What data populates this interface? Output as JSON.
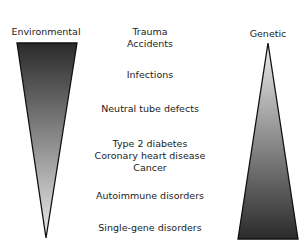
{
  "left_column": {
    "title": "Environmental"
  },
  "right_column": {
    "title": "Genetic"
  },
  "center_items": [
    {
      "lines": [
        "Trauma",
        "Accidents"
      ]
    },
    {
      "lines": [
        "Infections"
      ]
    },
    {
      "lines": [
        "Neutral tube defects"
      ]
    },
    {
      "lines": [
        "Type 2 diabetes",
        "Coronary heart disease",
        "Cancer"
      ]
    },
    {
      "lines": [
        "Autoimmune disorders"
      ]
    },
    {
      "lines": [
        "Single-gene disorders"
      ]
    }
  ],
  "colors": {
    "dark": "#2a2a2a",
    "light": "#e8e8e8",
    "outline": "#111111"
  }
}
